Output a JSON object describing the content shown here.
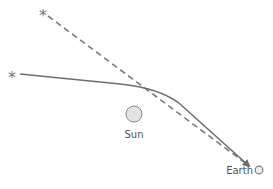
{
  "diagram": {
    "labels": {
      "sun": "Sun",
      "earth": "Earth",
      "apparent_star": "*",
      "actual_star": "*"
    },
    "colors": {
      "line": "#6e6e6e",
      "dashed_line": "#7a7a7a",
      "sun_fill": "#e3e3e3",
      "sun_stroke": "#8a8a8a",
      "earth_fill": "#eeeeee",
      "earth_stroke": "#777777",
      "text": "#555555"
    },
    "elements": [
      {
        "id": "apparent-star",
        "type": "star",
        "x": 45,
        "y": 12
      },
      {
        "id": "actual-star",
        "type": "star",
        "x": 14,
        "y": 74
      },
      {
        "id": "apparent-path",
        "type": "dashed-line",
        "from": [
          48,
          16
        ],
        "to": [
          250,
          166
        ]
      },
      {
        "id": "actual-path",
        "type": "curved-arrow",
        "from": [
          20,
          74
        ],
        "to": [
          250,
          166
        ],
        "bend_near": [
          175,
          95
        ]
      },
      {
        "id": "sun",
        "type": "circle",
        "cx": 134,
        "cy": 114,
        "r": 8
      },
      {
        "id": "earth",
        "type": "circle",
        "cx": 259,
        "cy": 170,
        "r": 4
      }
    ]
  }
}
